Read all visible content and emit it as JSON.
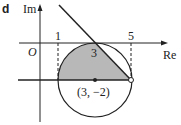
{
  "figure": {
    "label": "d",
    "y_axis_label": "Im",
    "x_axis_label": "Re",
    "origin_label": "O",
    "tick_1": "1",
    "tick_3": "3",
    "tick_5": "5",
    "center_label": "(3, −2)"
  },
  "colors": {
    "shade": "#b8b8b8",
    "line": "#222222"
  }
}
